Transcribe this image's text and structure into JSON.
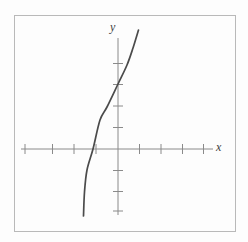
{
  "figure": {
    "x_axis_label": "x",
    "y_axis_label": "y"
  },
  "chart_data": {
    "type": "line",
    "title": "",
    "xlabel": "x",
    "ylabel": "y",
    "xlim": [
      -4.5,
      4.5
    ],
    "ylim": [
      -3.6,
      5.6
    ],
    "x_ticks": [
      -4,
      -3,
      -2,
      -1,
      1,
      2,
      3,
      4
    ],
    "y_ticks": [
      -3,
      -2,
      -1,
      1,
      2,
      3,
      4
    ],
    "tick_labels_shown": false,
    "grid": false,
    "legend": false,
    "series": [
      {
        "name": "increasing cubic-like curve",
        "points": [
          [
            -1.6,
            -3.1
          ],
          [
            -1.56,
            -2.0
          ],
          [
            -1.44,
            -1.0
          ],
          [
            -1.16,
            0.0
          ],
          [
            -0.84,
            1.35
          ],
          [
            -0.51,
            1.95
          ],
          [
            0.0,
            3.0
          ],
          [
            0.42,
            3.9
          ],
          [
            0.65,
            4.6
          ],
          [
            0.93,
            5.5
          ]
        ]
      }
    ],
    "notable_points": {
      "y_intercept": [
        0,
        3
      ],
      "x_intercept": [
        -1.16,
        0
      ]
    }
  },
  "plot_px": {
    "width": 248,
    "height": 242,
    "origin": {
      "x": 118,
      "y": 149
    },
    "unit_px": 21.5,
    "x_axis": {
      "y": 149,
      "x1": 21,
      "x2": 213
    },
    "y_axis": {
      "x": 118,
      "y1": 38,
      "y2": 215
    },
    "x_tick_xs": [
      25,
      52.5,
      74,
      96,
      139.5,
      161,
      182.5,
      203.5
    ],
    "y_tick_ys": [
      63.5,
      84.5,
      106,
      127.5,
      170.5,
      191.5,
      211
    ],
    "tick_half": 5,
    "curve_px": [
      [
        138.5,
        30
      ],
      [
        133,
        48
      ],
      [
        127,
        65
      ],
      [
        118,
        84
      ],
      [
        107,
        107
      ],
      [
        100,
        120
      ],
      [
        93,
        149
      ],
      [
        87,
        170
      ],
      [
        84.5,
        192
      ],
      [
        83.5,
        216
      ]
    ],
    "colors": {
      "background": "#fdfdfd",
      "frame": "#b9b9b9",
      "axis": "#8a8a8a",
      "curve": "#4b4b4b",
      "label": "#3f3f3f"
    }
  }
}
